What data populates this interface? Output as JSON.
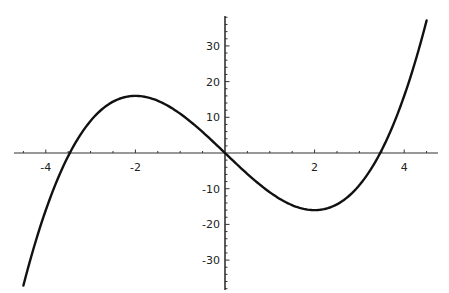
{
  "chart_data": {
    "type": "line",
    "title": "",
    "xlabel": "",
    "ylabel": "",
    "function": "x^3 - 12x",
    "xlim": [
      -4.5,
      4.5
    ],
    "ylim": [
      -37,
      37
    ],
    "grid": false,
    "legend": null,
    "x_ticks": [
      -4,
      -2,
      2,
      4
    ],
    "x_tick_labels": [
      "-4",
      "-2",
      "2",
      "4"
    ],
    "y_ticks": [
      -30,
      -20,
      -10,
      10,
      20,
      30
    ],
    "y_tick_labels": [
      "-30",
      "-20",
      "-10",
      "10",
      "20",
      "30"
    ],
    "series": [
      {
        "name": "f(x)",
        "x": [
          -4.5,
          -4,
          -3.46,
          -3,
          -2,
          -1,
          0,
          1,
          2,
          3,
          3.46,
          4,
          4.5
        ],
        "values": [
          -37.1,
          -16,
          0,
          9,
          16,
          11,
          0,
          -11,
          -16,
          -9,
          0,
          16,
          37.1
        ]
      }
    ],
    "annotations": {
      "local_max": {
        "x": -2,
        "y": 16
      },
      "local_min": {
        "x": 2,
        "y": -16
      },
      "roots": [
        -3.46,
        0,
        3.46
      ]
    }
  },
  "colors": {
    "curve": "#111111",
    "axes": "#333333",
    "background": "#ffffff"
  }
}
